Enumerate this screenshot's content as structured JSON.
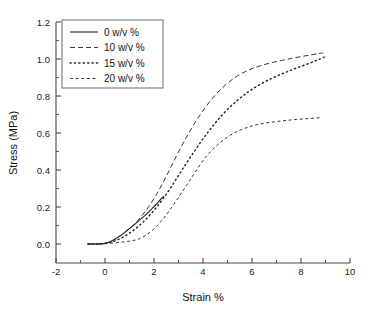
{
  "chart_data": {
    "type": "line",
    "title": "",
    "xlabel": "Strain %",
    "ylabel": "Stress (MPa)",
    "xlim": [
      -2,
      10
    ],
    "ylim": [
      0.0,
      1.2
    ],
    "xticks": [
      -2,
      0,
      2,
      4,
      6,
      8,
      10
    ],
    "xtick_labels": [
      "-2",
      "0",
      "2",
      "4",
      "6",
      "8",
      "10"
    ],
    "yticks": [
      0.0,
      0.2,
      0.4,
      0.6,
      0.8,
      1.0,
      1.2
    ],
    "ytick_labels": [
      "0.0",
      "0.2",
      "0.4",
      "0.6",
      "0.8",
      "1.0",
      "1.2"
    ],
    "minor_ticks": true,
    "grid": false,
    "legend_position": "upper-left",
    "series": [
      {
        "name": "0  w/v %",
        "style": "solid",
        "color": "#2b2b2b",
        "points": [
          [
            -0.7,
            0.0
          ],
          [
            -0.4,
            0.0
          ],
          [
            -0.1,
            0.002
          ],
          [
            0.0,
            0.004
          ],
          [
            0.2,
            0.012
          ],
          [
            0.45,
            0.03
          ],
          [
            0.7,
            0.052
          ],
          [
            0.95,
            0.078
          ],
          [
            1.2,
            0.105
          ],
          [
            1.45,
            0.133
          ],
          [
            1.7,
            0.163
          ],
          [
            1.95,
            0.196
          ],
          [
            2.15,
            0.223
          ],
          [
            2.3,
            0.246
          ],
          [
            2.4,
            0.258
          ]
        ]
      },
      {
        "name": "10 w/v %",
        "style": "dashed",
        "color": "#2b2b2b",
        "points": [
          [
            -0.7,
            0.0
          ],
          [
            -0.3,
            0.0
          ],
          [
            0.0,
            0.004
          ],
          [
            0.3,
            0.018
          ],
          [
            0.6,
            0.042
          ],
          [
            0.9,
            0.072
          ],
          [
            1.2,
            0.108
          ],
          [
            1.5,
            0.152
          ],
          [
            1.8,
            0.205
          ],
          [
            2.1,
            0.268
          ],
          [
            2.4,
            0.34
          ],
          [
            2.7,
            0.418
          ],
          [
            3.0,
            0.498
          ],
          [
            3.3,
            0.572
          ],
          [
            3.6,
            0.64
          ],
          [
            3.9,
            0.702
          ],
          [
            4.2,
            0.757
          ],
          [
            4.5,
            0.805
          ],
          [
            4.8,
            0.846
          ],
          [
            5.1,
            0.88
          ],
          [
            5.4,
            0.908
          ],
          [
            5.7,
            0.93
          ],
          [
            6.0,
            0.948
          ],
          [
            6.4,
            0.966
          ],
          [
            6.8,
            0.98
          ],
          [
            7.2,
            0.992
          ],
          [
            7.6,
            1.003
          ],
          [
            8.0,
            1.013
          ],
          [
            8.4,
            1.022
          ],
          [
            8.7,
            1.029
          ],
          [
            8.9,
            1.033
          ]
        ]
      },
      {
        "name": "15 w/v %",
        "style": "dotted",
        "color": "#2b2b2b",
        "points": [
          [
            -0.7,
            0.0
          ],
          [
            -0.3,
            0.0
          ],
          [
            0.0,
            0.003
          ],
          [
            0.3,
            0.012
          ],
          [
            0.6,
            0.028
          ],
          [
            0.9,
            0.05
          ],
          [
            1.2,
            0.078
          ],
          [
            1.5,
            0.112
          ],
          [
            1.8,
            0.152
          ],
          [
            2.1,
            0.198
          ],
          [
            2.4,
            0.25
          ],
          [
            2.7,
            0.308
          ],
          [
            3.0,
            0.37
          ],
          [
            3.3,
            0.432
          ],
          [
            3.6,
            0.492
          ],
          [
            3.9,
            0.55
          ],
          [
            4.2,
            0.604
          ],
          [
            4.5,
            0.654
          ],
          [
            4.8,
            0.7
          ],
          [
            5.1,
            0.74
          ],
          [
            5.4,
            0.776
          ],
          [
            5.7,
            0.808
          ],
          [
            6.0,
            0.836
          ],
          [
            6.4,
            0.868
          ],
          [
            6.8,
            0.895
          ],
          [
            7.2,
            0.918
          ],
          [
            7.6,
            0.94
          ],
          [
            8.0,
            0.96
          ],
          [
            8.4,
            0.98
          ],
          [
            8.7,
            0.996
          ],
          [
            8.95,
            1.01
          ]
        ]
      },
      {
        "name": "20 w/v %",
        "style": "fine-dashed",
        "color": "#2b2b2b",
        "points": [
          [
            -0.7,
            0.0
          ],
          [
            -0.3,
            0.0
          ],
          [
            0.0,
            0.002
          ],
          [
            0.4,
            0.006
          ],
          [
            0.8,
            0.012
          ],
          [
            1.1,
            0.018
          ],
          [
            1.4,
            0.028
          ],
          [
            1.7,
            0.05
          ],
          [
            2.0,
            0.082
          ],
          [
            2.3,
            0.124
          ],
          [
            2.6,
            0.175
          ],
          [
            2.9,
            0.232
          ],
          [
            3.2,
            0.292
          ],
          [
            3.5,
            0.352
          ],
          [
            3.8,
            0.412
          ],
          [
            4.1,
            0.468
          ],
          [
            4.4,
            0.512
          ],
          [
            4.7,
            0.548
          ],
          [
            5.0,
            0.578
          ],
          [
            5.3,
            0.602
          ],
          [
            5.6,
            0.62
          ],
          [
            5.9,
            0.634
          ],
          [
            6.2,
            0.645
          ],
          [
            6.6,
            0.655
          ],
          [
            7.0,
            0.662
          ],
          [
            7.4,
            0.668
          ],
          [
            7.8,
            0.673
          ],
          [
            8.2,
            0.677
          ],
          [
            8.6,
            0.681
          ],
          [
            8.85,
            0.683
          ]
        ]
      }
    ],
    "legend_entries": [
      {
        "label": "0  w/v %",
        "style": "solid"
      },
      {
        "label": "10 w/v %",
        "style": "dashed"
      },
      {
        "label": "15 w/v %",
        "style": "dotted"
      },
      {
        "label": "20 w/v %",
        "style": "fine-dashed"
      }
    ]
  }
}
